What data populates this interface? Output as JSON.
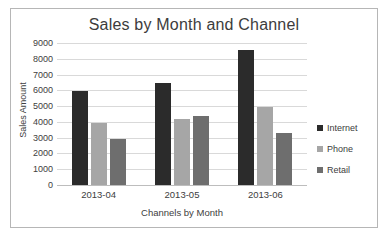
{
  "chart_data": {
    "type": "bar",
    "title": "Sales by Month and Channel",
    "xlabel": "Channels by Month",
    "ylabel": "Sales Amount",
    "categories": [
      "2013-04",
      "2013-05",
      "2013-06"
    ],
    "series": [
      {
        "name": "Internet",
        "color": "#2b2b2b",
        "values": [
          5950,
          6450,
          8550
        ]
      },
      {
        "name": "Phone",
        "color": "#a6a6a6",
        "values": [
          3950,
          4200,
          4950
        ]
      },
      {
        "name": "Retail",
        "color": "#6e6e6e",
        "values": [
          2900,
          4400,
          3300
        ]
      }
    ],
    "ylim": [
      0,
      9000
    ],
    "yticks": [
      9000,
      8000,
      7000,
      6000,
      5000,
      4000,
      3000,
      2000,
      1000,
      0
    ],
    "grid": "horizontal",
    "legend_position": "right"
  }
}
